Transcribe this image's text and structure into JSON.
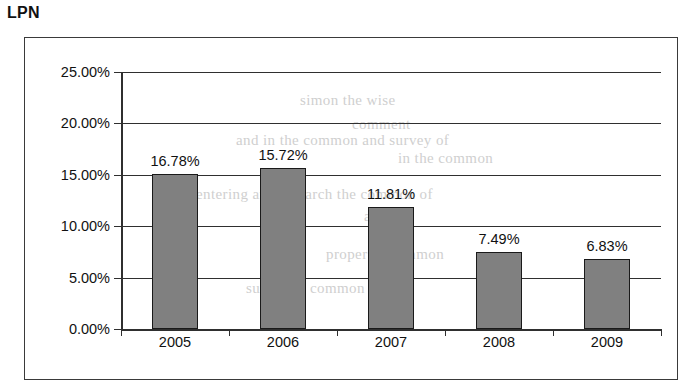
{
  "page": {
    "title": "LPN"
  },
  "chart_data": {
    "type": "bar",
    "title": "LPN",
    "xlabel": "",
    "ylabel": "",
    "categories": [
      "2005",
      "2006",
      "2007",
      "2008",
      "2009"
    ],
    "values": [
      16.78,
      15.72,
      11.81,
      7.49,
      6.83
    ],
    "data_labels": [
      "16.78%",
      "15.72%",
      "11.81%",
      "7.49%",
      "6.83%"
    ],
    "bar_draw_values": [
      15.05,
      15.65,
      11.86,
      7.49,
      6.81
    ],
    "ylim": [
      0,
      25
    ],
    "ytick_values": [
      25,
      20,
      15,
      10,
      5,
      0
    ],
    "ytick_labels": [
      "25.00%",
      "20.00%",
      "15.00%",
      "10.00%",
      "5.00%",
      "0.00%"
    ],
    "grid": true,
    "legend": false,
    "colors": {
      "bar_fill": "#808080",
      "bar_outline": "#1a1a1a",
      "axis": "#2f2f2f",
      "frame": "#3a3a3a",
      "background": "#ffffff",
      "text": "#111111"
    }
  },
  "background_artifacts": [
    {
      "text": "simon the wise",
      "x": 300,
      "y": 92
    },
    {
      "text": "comment",
      "x": 352,
      "y": 116
    },
    {
      "text": "and in the common and survey of",
      "x": 236,
      "y": 132
    },
    {
      "text": "in the common",
      "x": 398,
      "y": 150
    },
    {
      "text": "entering and research the common of",
      "x": 196,
      "y": 186
    },
    {
      "text": "and in",
      "x": 364,
      "y": 208
    },
    {
      "text": "proper of common",
      "x": 326,
      "y": 246
    },
    {
      "text": "survey of common",
      "x": 246,
      "y": 280
    }
  ]
}
